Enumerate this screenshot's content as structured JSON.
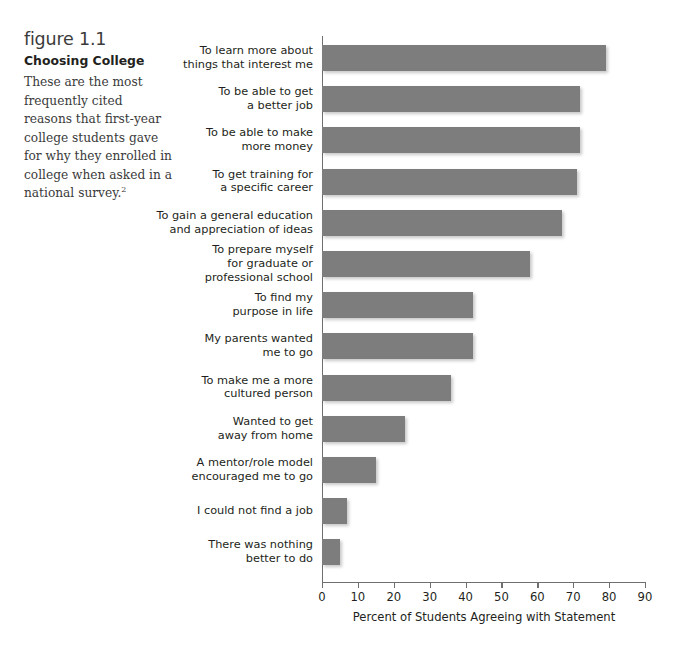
{
  "caption": {
    "figure_number": "figure 1.1",
    "title": "Choosing College",
    "description": "These are the most frequently cited reasons that first-year college students gave for why they enrolled in college when asked in a national survey.",
    "footnote_marker": "2"
  },
  "colors": {
    "bar_fill": "#7d7d7d",
    "axis": "#6f6f6f",
    "text": "#231f20",
    "background": "#ffffff"
  },
  "chart_data": {
    "type": "bar",
    "orientation": "horizontal",
    "title": "Choosing College",
    "xlabel": "Percent of Students Agreeing with Statement",
    "ylabel": "",
    "xlim": [
      0,
      90
    ],
    "xticks": [
      0,
      10,
      20,
      30,
      40,
      50,
      60,
      70,
      80,
      90
    ],
    "xtick_labels": [
      "0",
      "10",
      "20",
      "30",
      "40",
      "50",
      "60",
      "70",
      "80",
      "90"
    ],
    "grid": false,
    "legend": false,
    "categories": [
      "To learn more about\nthings that interest me",
      "To be able to get\na better job",
      "To be able to make\nmore money",
      "To get training for\na specific career",
      "To gain a general education\nand appreciation of ideas",
      "To prepare myself\nfor graduate or\nprofessional school",
      "To find my\npurpose in life",
      "My parents wanted\nme to go",
      "To make me a more\ncultured person",
      "Wanted to get\naway from home",
      "A mentor/role model\nencouraged me to go",
      "I could not find a job",
      "There was nothing\nbetter to do"
    ],
    "values": [
      79,
      72,
      72,
      71,
      67,
      58,
      42,
      42,
      36,
      23,
      15,
      7,
      5
    ]
  }
}
